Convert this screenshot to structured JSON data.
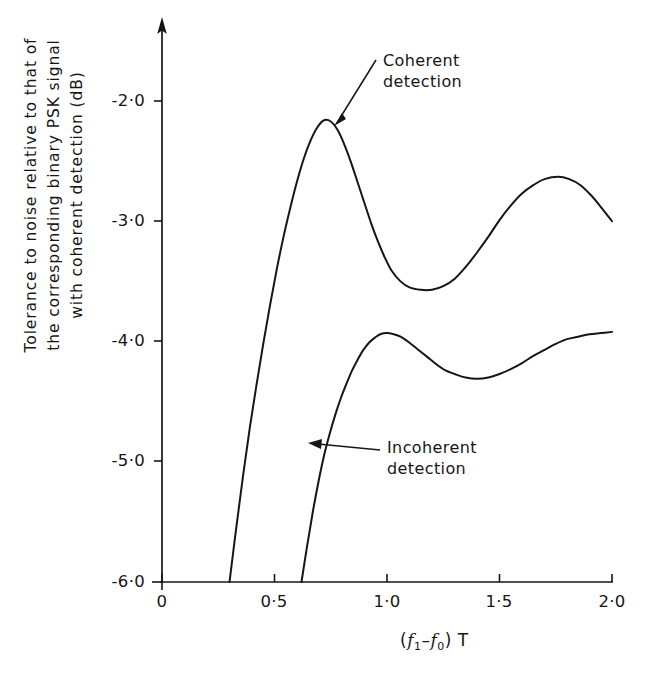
{
  "figure": {
    "background_color": "#ffffff",
    "ink_color": "#161616"
  },
  "axes": {
    "y_title_lines": [
      "Tolerance to noise relative to  that  of",
      "the corresponding binary  PSK  signal",
      "with coherent detection (dB)"
    ],
    "x_title_parts": {
      "open_paren": "(",
      "f1": "f",
      "f1_sub": "1",
      "minus": "–",
      "f0": "f",
      "f0_sub": "0",
      "close_paren": ")",
      "T": "T"
    },
    "y_ticks": [
      "-2·0",
      "-3·0",
      "-4·0",
      "-5·0",
      "-6·0"
    ],
    "x_ticks": [
      "0",
      "0·5",
      "1·0",
      "1·5",
      "2·0"
    ]
  },
  "annotations": {
    "coherent": {
      "line1": "Coherent",
      "line2": "detection"
    },
    "incoherent": {
      "line1": "Incoherent",
      "line2": "detection"
    }
  },
  "caption": {
    "clipped_text": ""
  },
  "chart_data": {
    "type": "line",
    "title": "",
    "subtitle": "",
    "xlabel": "( f1 - f0 ) T",
    "ylabel": "Tolerance to noise relative to that of the corresponding binary PSK signal with coherent detection (dB)",
    "xlim": [
      0,
      2.0
    ],
    "ylim": [
      -6.0,
      -1.55
    ],
    "x_tick_values": [
      0,
      0.5,
      1.0,
      1.5,
      2.0
    ],
    "y_tick_values": [
      -2.0,
      -3.0,
      -4.0,
      -5.0,
      -6.0
    ],
    "grid": false,
    "legend": "inline-annotations",
    "series": [
      {
        "name": "Coherent detection",
        "points": [
          [
            0.3,
            -6.0
          ],
          [
            0.33,
            -5.55
          ],
          [
            0.36,
            -5.12
          ],
          [
            0.39,
            -4.72
          ],
          [
            0.42,
            -4.36
          ],
          [
            0.45,
            -4.02
          ],
          [
            0.48,
            -3.7
          ],
          [
            0.51,
            -3.4
          ],
          [
            0.54,
            -3.13
          ],
          [
            0.57,
            -2.89
          ],
          [
            0.6,
            -2.67
          ],
          [
            0.63,
            -2.48
          ],
          [
            0.66,
            -2.33
          ],
          [
            0.69,
            -2.22
          ],
          [
            0.72,
            -2.16
          ],
          [
            0.75,
            -2.17
          ],
          [
            0.78,
            -2.24
          ],
          [
            0.81,
            -2.36
          ],
          [
            0.84,
            -2.51
          ],
          [
            0.87,
            -2.68
          ],
          [
            0.9,
            -2.85
          ],
          [
            0.93,
            -3.02
          ],
          [
            0.96,
            -3.17
          ],
          [
            0.99,
            -3.3
          ],
          [
            1.02,
            -3.41
          ],
          [
            1.06,
            -3.5
          ],
          [
            1.1,
            -3.55
          ],
          [
            1.15,
            -3.57
          ],
          [
            1.2,
            -3.57
          ],
          [
            1.25,
            -3.54
          ],
          [
            1.3,
            -3.48
          ],
          [
            1.35,
            -3.38
          ],
          [
            1.4,
            -3.26
          ],
          [
            1.45,
            -3.13
          ],
          [
            1.5,
            -2.99
          ],
          [
            1.55,
            -2.87
          ],
          [
            1.6,
            -2.77
          ],
          [
            1.65,
            -2.7
          ],
          [
            1.7,
            -2.65
          ],
          [
            1.76,
            -2.63
          ],
          [
            1.81,
            -2.65
          ],
          [
            1.86,
            -2.7
          ],
          [
            1.91,
            -2.79
          ],
          [
            1.95,
            -2.88
          ],
          [
            2.0,
            -3.0
          ]
        ],
        "key_points": {
          "left_intercept_at_minus6": 0.3,
          "first_maximum": {
            "x": 0.72,
            "y": -2.16
          },
          "minimum": {
            "x": 1.23,
            "y": -3.57
          },
          "second_maximum": {
            "x": 1.76,
            "y": -2.63
          },
          "value_at_x2": -3.0
        }
      },
      {
        "name": "Incoherent detection",
        "points": [
          [
            0.62,
            -6.0
          ],
          [
            0.645,
            -5.7
          ],
          [
            0.67,
            -5.42
          ],
          [
            0.695,
            -5.17
          ],
          [
            0.72,
            -4.95
          ],
          [
            0.745,
            -4.77
          ],
          [
            0.77,
            -4.61
          ],
          [
            0.795,
            -4.47
          ],
          [
            0.82,
            -4.35
          ],
          [
            0.845,
            -4.24
          ],
          [
            0.87,
            -4.15
          ],
          [
            0.895,
            -4.07
          ],
          [
            0.92,
            -4.01
          ],
          [
            0.945,
            -3.97
          ],
          [
            0.97,
            -3.94
          ],
          [
            1.0,
            -3.93
          ],
          [
            1.03,
            -3.94
          ],
          [
            1.06,
            -3.96
          ],
          [
            1.1,
            -4.01
          ],
          [
            1.14,
            -4.07
          ],
          [
            1.18,
            -4.13
          ],
          [
            1.22,
            -4.19
          ],
          [
            1.26,
            -4.24
          ],
          [
            1.3,
            -4.27
          ],
          [
            1.35,
            -4.3
          ],
          [
            1.4,
            -4.31
          ],
          [
            1.45,
            -4.3
          ],
          [
            1.5,
            -4.27
          ],
          [
            1.55,
            -4.23
          ],
          [
            1.6,
            -4.18
          ],
          [
            1.65,
            -4.12
          ],
          [
            1.7,
            -4.07
          ],
          [
            1.75,
            -4.02
          ],
          [
            1.8,
            -3.98
          ],
          [
            1.85,
            -3.96
          ],
          [
            1.9,
            -3.94
          ],
          [
            1.95,
            -3.93
          ],
          [
            2.0,
            -3.92
          ]
        ],
        "key_points": {
          "left_intercept_at_minus6": 0.62,
          "maximum": {
            "x": 1.0,
            "y": -3.93
          },
          "minimum": {
            "x": 1.42,
            "y": -4.31
          },
          "value_at_x2": -3.92
        }
      }
    ]
  }
}
